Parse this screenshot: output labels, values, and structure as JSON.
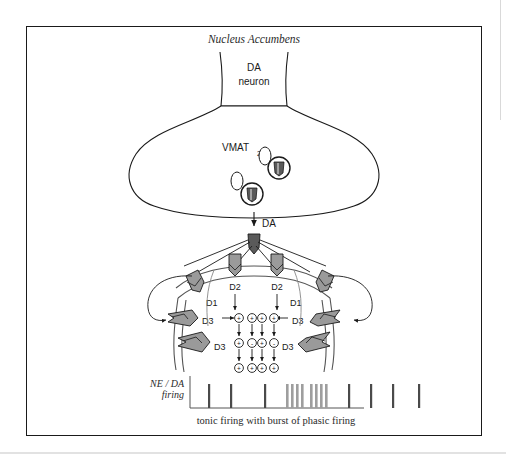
{
  "figure": {
    "title": "Nucleus Accumbens",
    "neuron_label_line1": "DA",
    "neuron_label_line2": "neuron",
    "vmat_label": "VMAT",
    "vmat_subscript": "2",
    "da_release_label": "DA",
    "caption": "tonic firing with burst of phasic firing",
    "axis_label_line1": "NE / DA",
    "axis_label_line2": "firing",
    "receptors": [
      {
        "name": "D2",
        "side": "center-left"
      },
      {
        "name": "D2",
        "side": "center-right"
      },
      {
        "name": "D1",
        "side": "left"
      },
      {
        "name": "D1",
        "side": "right"
      },
      {
        "name": "D3",
        "side": "left-upper"
      },
      {
        "name": "D3",
        "side": "left-lower"
      },
      {
        "name": "D3",
        "side": "right-upper"
      },
      {
        "name": "D3",
        "side": "right-lower"
      }
    ],
    "signal_rows": [
      [
        "+",
        "+",
        "+",
        "+"
      ],
      [
        "+",
        "-",
        "+",
        "-"
      ],
      [
        "+",
        "+",
        "+",
        "+"
      ]
    ],
    "colors": {
      "outline": "#1a1a1a",
      "receptor_fill": "#9a9a9a",
      "vesicle_fill": "#5a5a5a",
      "spike": "#4a4a4a",
      "burst": "#9e9e9e",
      "frame": "#1a1a1a"
    }
  },
  "firing_trace": {
    "tonic_before": [
      18,
      40,
      74
    ],
    "burst": [
      96,
      101,
      106,
      111,
      120,
      125,
      130,
      135
    ],
    "tonic_after": [
      158,
      180,
      202,
      228
    ]
  }
}
